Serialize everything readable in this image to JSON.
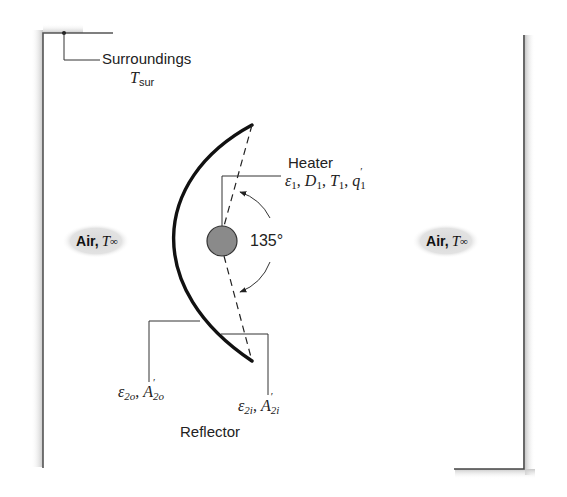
{
  "diagram": {
    "type": "heat-transfer-schematic",
    "surroundings": {
      "label": "Surroundings",
      "temp_symbol": "T",
      "temp_subscript": "sur"
    },
    "heater": {
      "label": "Heater",
      "emissivity": "ε",
      "emissivity_sub": "1",
      "diameter": "D",
      "diameter_sub": "1",
      "temperature": "T",
      "temperature_sub": "1",
      "heat_rate": "q",
      "heat_rate_sub": "1",
      "heat_rate_prime": "′",
      "fill_color": "#8a8a8a"
    },
    "angle": {
      "value": "135°"
    },
    "reflector": {
      "label": "Reflector",
      "outer": {
        "emissivity": "ε",
        "emissivity_sub": "2o",
        "area": "A",
        "area_prime": "′",
        "area_sub": "2o"
      },
      "inner": {
        "emissivity": "ε",
        "emissivity_sub": "2i",
        "area": "A",
        "area_prime": "′",
        "area_sub": "2i"
      }
    },
    "air_left": {
      "label": "Air,",
      "temp_symbol": "T",
      "temp_subscript": "∞"
    },
    "air_right": {
      "label": "Air,",
      "temp_symbol": "T",
      "temp_subscript": "∞"
    },
    "separator": ","
  }
}
